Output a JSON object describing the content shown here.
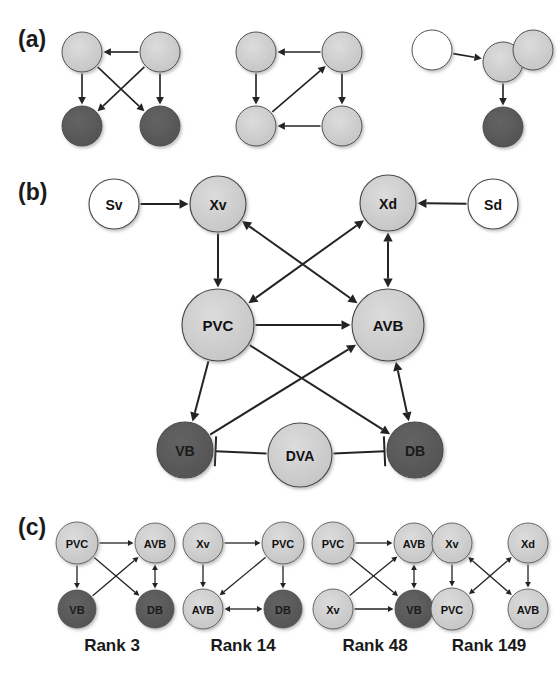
{
  "figure": {
    "background": "#ffffff",
    "colors": {
      "light_node": "#cdcdcd",
      "dark_node": "#595959",
      "white_node": "#ffffff",
      "node_outline": "#4a4a4a",
      "edge": "#232323",
      "text": "#1a1a1a"
    }
  },
  "panels": [
    {
      "id": "panel-a",
      "label": "(a)",
      "label_pos": {
        "x": 18,
        "y": 47
      },
      "motifs": [
        {
          "id": "motif-a1",
          "nodes": [
            {
              "id": "a1-tl",
              "label": "",
              "x": 82,
              "y": 52,
              "r": 20,
              "fill": "light"
            },
            {
              "id": "a1-tr",
              "label": "",
              "x": 160,
              "y": 52,
              "r": 20,
              "fill": "light"
            },
            {
              "id": "a1-bl",
              "label": "",
              "x": 82,
              "y": 126,
              "r": 20,
              "fill": "dark"
            },
            {
              "id": "a1-br",
              "label": "",
              "x": 160,
              "y": 126,
              "r": 20,
              "fill": "dark"
            }
          ],
          "edges": [
            {
              "from": "a1-tr",
              "to": "a1-tl",
              "type": "arrow"
            },
            {
              "from": "a1-tl",
              "to": "a1-bl",
              "type": "arrow"
            },
            {
              "from": "a1-tl",
              "to": "a1-br",
              "type": "arrow"
            },
            {
              "from": "a1-tr",
              "to": "a1-bl",
              "type": "arrow"
            },
            {
              "from": "a1-tr",
              "to": "a1-br",
              "type": "arrow"
            }
          ]
        },
        {
          "id": "motif-a2",
          "nodes": [
            {
              "id": "a2-tl",
              "label": "",
              "x": 256,
              "y": 52,
              "r": 20,
              "fill": "light"
            },
            {
              "id": "a2-tr",
              "label": "",
              "x": 342,
              "y": 52,
              "r": 20,
              "fill": "light"
            },
            {
              "id": "a2-bl",
              "label": "",
              "x": 256,
              "y": 126,
              "r": 20,
              "fill": "light"
            },
            {
              "id": "a2-br",
              "label": "",
              "x": 342,
              "y": 126,
              "r": 20,
              "fill": "light"
            }
          ],
          "edges": [
            {
              "from": "a2-tr",
              "to": "a2-tl",
              "type": "arrow"
            },
            {
              "from": "a2-tl",
              "to": "a2-bl",
              "type": "arrow"
            },
            {
              "from": "a2-tr",
              "to": "a2-br",
              "type": "arrow"
            },
            {
              "from": "a2-br",
              "to": "a2-bl",
              "type": "arrow"
            },
            {
              "from": "a2-bl",
              "to": "a2-tr",
              "type": "arrow"
            }
          ]
        },
        {
          "id": "motif-a3",
          "nodes": [
            {
              "id": "a3-left",
              "label": "",
              "x": 432,
              "y": 50,
              "r": 20,
              "fill": "white"
            },
            {
              "id": "a3-mid",
              "label": "",
              "x": 503,
              "y": 62,
              "r": 20,
              "fill": "light"
            },
            {
              "id": "a3-right",
              "label": "",
              "x": 533,
              "y": 50,
              "r": 20,
              "fill": "light"
            },
            {
              "id": "a3-bot",
              "label": "",
              "x": 503,
              "y": 127,
              "r": 20,
              "fill": "dark"
            }
          ],
          "edges": [
            {
              "from": "a3-left",
              "to": "a3-mid",
              "type": "arrow"
            },
            {
              "from": "a3-right",
              "to": "a3-mid",
              "type": "arrow"
            },
            {
              "from": "a3-mid",
              "to": "a3-bot",
              "type": "arrow"
            }
          ]
        }
      ]
    },
    {
      "id": "panel-b",
      "label": "(b)",
      "label_pos": {
        "x": 18,
        "y": 200
      },
      "motifs": [
        {
          "id": "motif-b",
          "nodes": [
            {
              "id": "b-sv",
              "label": "Sv",
              "x": 114,
              "y": 204,
              "r": 25,
              "fill": "white",
              "font": 14
            },
            {
              "id": "b-xv",
              "label": "Xv",
              "x": 218,
              "y": 204,
              "r": 28,
              "fill": "light",
              "font": 14
            },
            {
              "id": "b-xd",
              "label": "Xd",
              "x": 388,
              "y": 203,
              "r": 28,
              "fill": "light",
              "font": 14
            },
            {
              "id": "b-sd",
              "label": "Sd",
              "x": 493,
              "y": 204,
              "r": 25,
              "fill": "white",
              "font": 14
            },
            {
              "id": "b-pvc",
              "label": "PVC",
              "x": 218,
              "y": 325,
              "r": 36,
              "fill": "light",
              "font": 15
            },
            {
              "id": "b-avb",
              "label": "AVB",
              "x": 388,
              "y": 325,
              "r": 36,
              "fill": "light",
              "font": 15
            },
            {
              "id": "b-vb",
              "label": "VB",
              "x": 185,
              "y": 450,
              "r": 28,
              "fill": "dark",
              "font": 14
            },
            {
              "id": "b-dva",
              "label": "DVA",
              "x": 300,
              "y": 455,
              "r": 32,
              "fill": "light",
              "font": 14
            },
            {
              "id": "b-db",
              "label": "DB",
              "x": 415,
              "y": 450,
              "r": 28,
              "fill": "dark",
              "font": 14
            }
          ],
          "edges": [
            {
              "from": "b-sv",
              "to": "b-xv",
              "type": "arrow"
            },
            {
              "from": "b-sd",
              "to": "b-xd",
              "type": "arrow"
            },
            {
              "from": "b-xv",
              "to": "b-pvc",
              "type": "arrow"
            },
            {
              "from": "b-xv",
              "to": "b-avb",
              "type": "biarrow"
            },
            {
              "from": "b-xd",
              "to": "b-pvc",
              "type": "biarrow"
            },
            {
              "from": "b-xd",
              "to": "b-avb",
              "type": "biarrow"
            },
            {
              "from": "b-pvc",
              "to": "b-avb",
              "type": "arrow"
            },
            {
              "from": "b-pvc",
              "to": "b-vb",
              "type": "arrow"
            },
            {
              "from": "b-pvc",
              "to": "b-db",
              "type": "arrow"
            },
            {
              "from": "b-vb",
              "to": "b-avb",
              "type": "arrow"
            },
            {
              "from": "b-avb",
              "to": "b-db",
              "type": "biarrow"
            },
            {
              "from": "b-dva",
              "to": "b-vb",
              "type": "inhibit"
            },
            {
              "from": "b-dva",
              "to": "b-db",
              "type": "inhibit"
            }
          ]
        }
      ]
    },
    {
      "id": "panel-c",
      "label": "(c)",
      "label_pos": {
        "x": 18,
        "y": 535
      },
      "motifs": [
        {
          "id": "motif-c1",
          "rank_label": "Rank 3",
          "rank_pos": {
            "x": 112,
            "y": 651
          },
          "nodes": [
            {
              "id": "c1-pvc",
              "label": "PVC",
              "x": 77,
              "y": 543,
              "r": 21,
              "fill": "light",
              "font": 11
            },
            {
              "id": "c1-avb",
              "label": "AVB",
              "x": 155,
              "y": 543,
              "r": 20,
              "fill": "light",
              "font": 11
            },
            {
              "id": "c1-vb",
              "label": "VB",
              "x": 77,
              "y": 609,
              "r": 19,
              "fill": "dark",
              "font": 11
            },
            {
              "id": "c1-db",
              "label": "DB",
              "x": 155,
              "y": 609,
              "r": 19,
              "fill": "dark",
              "font": 11
            }
          ],
          "edges": [
            {
              "from": "c1-pvc",
              "to": "c1-avb",
              "type": "arrow"
            },
            {
              "from": "c1-pvc",
              "to": "c1-vb",
              "type": "arrow"
            },
            {
              "from": "c1-pvc",
              "to": "c1-db",
              "type": "arrow"
            },
            {
              "from": "c1-vb",
              "to": "c1-avb",
              "type": "arrow"
            },
            {
              "from": "c1-avb",
              "to": "c1-db",
              "type": "biarrow"
            }
          ]
        },
        {
          "id": "motif-c2",
          "rank_label": "Rank 14",
          "rank_pos": {
            "x": 243,
            "y": 651
          },
          "nodes": [
            {
              "id": "c2-xv",
              "label": "Xv",
              "x": 203,
              "y": 543,
              "r": 20,
              "fill": "light",
              "font": 11
            },
            {
              "id": "c2-pvc",
              "label": "PVC",
              "x": 283,
              "y": 543,
              "r": 21,
              "fill": "light",
              "font": 11
            },
            {
              "id": "c2-avb",
              "label": "AVB",
              "x": 203,
              "y": 609,
              "r": 20,
              "fill": "light",
              "font": 11
            },
            {
              "id": "c2-db",
              "label": "DB",
              "x": 283,
              "y": 609,
              "r": 19,
              "fill": "dark",
              "font": 11
            }
          ],
          "edges": [
            {
              "from": "c2-xv",
              "to": "c2-pvc",
              "type": "arrow"
            },
            {
              "from": "c2-xv",
              "to": "c2-avb",
              "type": "arrow"
            },
            {
              "from": "c2-pvc",
              "to": "c2-avb",
              "type": "arrow"
            },
            {
              "from": "c2-pvc",
              "to": "c2-db",
              "type": "arrow"
            },
            {
              "from": "c2-avb",
              "to": "c2-db",
              "type": "biarrow"
            }
          ]
        },
        {
          "id": "motif-c3",
          "rank_label": "Rank 48",
          "rank_pos": {
            "x": 375,
            "y": 651
          },
          "nodes": [
            {
              "id": "c3-pvc",
              "label": "PVC",
              "x": 333,
              "y": 543,
              "r": 21,
              "fill": "light",
              "font": 11
            },
            {
              "id": "c3-avb",
              "label": "AVB",
              "x": 414,
              "y": 543,
              "r": 20,
              "fill": "light",
              "font": 11
            },
            {
              "id": "c3-xv",
              "label": "Xv",
              "x": 333,
              "y": 609,
              "r": 20,
              "fill": "light",
              "font": 11
            },
            {
              "id": "c3-vb",
              "label": "VB",
              "x": 414,
              "y": 609,
              "r": 19,
              "fill": "dark",
              "font": 11
            }
          ],
          "edges": [
            {
              "from": "c3-pvc",
              "to": "c3-avb",
              "type": "arrow"
            },
            {
              "from": "c3-pvc",
              "to": "c3-vb",
              "type": "arrow"
            },
            {
              "from": "c3-xv",
              "to": "c3-avb",
              "type": "arrow"
            },
            {
              "from": "c3-xv",
              "to": "c3-vb",
              "type": "arrow"
            },
            {
              "from": "c3-avb",
              "to": "c3-vb",
              "type": "biarrow"
            }
          ]
        },
        {
          "id": "motif-c4",
          "rank_label": "Rank 149",
          "rank_pos": {
            "x": 489,
            "y": 651
          },
          "nodes": [
            {
              "id": "c4-xv",
              "label": "Xv",
              "x": 452,
              "y": 543,
              "r": 20,
              "fill": "light",
              "font": 11
            },
            {
              "id": "c4-xd",
              "label": "Xd",
              "x": 528,
              "y": 543,
              "r": 20,
              "fill": "light",
              "font": 11
            },
            {
              "id": "c4-pvc",
              "label": "PVC",
              "x": 452,
              "y": 609,
              "r": 21,
              "fill": "light",
              "font": 11
            },
            {
              "id": "c4-avb",
              "label": "AVB",
              "x": 528,
              "y": 609,
              "r": 20,
              "fill": "light",
              "font": 11
            }
          ],
          "edges": [
            {
              "from": "c4-xv",
              "to": "c4-pvc",
              "type": "arrow"
            },
            {
              "from": "c4-xd",
              "to": "c4-avb",
              "type": "arrow"
            },
            {
              "from": "c4-xv",
              "to": "c4-avb",
              "type": "biarrow"
            },
            {
              "from": "c4-xd",
              "to": "c4-pvc",
              "type": "biarrow"
            }
          ]
        }
      ]
    }
  ]
}
